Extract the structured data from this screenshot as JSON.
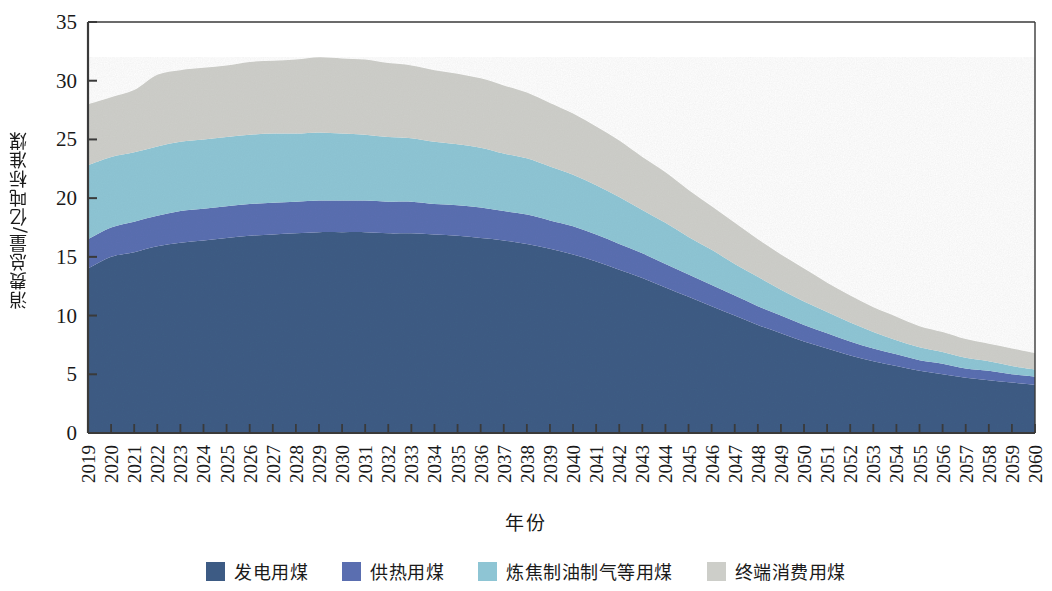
{
  "chart_data": {
    "type": "area",
    "stacked": true,
    "title": "",
    "xlabel": "年份",
    "ylabel": "消费总量/亿吨标准煤",
    "xlim": [
      2019,
      2060
    ],
    "ylim": [
      0,
      35
    ],
    "ytick_step": 5,
    "yticks": [
      0,
      5,
      10,
      15,
      20,
      25,
      30,
      35
    ],
    "grid": false,
    "legend_position": "bottom",
    "categories": [
      2019,
      2020,
      2021,
      2022,
      2023,
      2024,
      2025,
      2026,
      2027,
      2028,
      2029,
      2030,
      2031,
      2032,
      2033,
      2034,
      2035,
      2036,
      2037,
      2038,
      2039,
      2040,
      2041,
      2042,
      2043,
      2044,
      2045,
      2046,
      2047,
      2048,
      2049,
      2050,
      2051,
      2052,
      2053,
      2054,
      2055,
      2056,
      2057,
      2058,
      2059,
      2060
    ],
    "series": [
      {
        "name": "发电用煤",
        "color": "#3d5b84",
        "values": [
          14.0,
          15.0,
          15.4,
          15.9,
          16.2,
          16.4,
          16.6,
          16.8,
          16.9,
          17.0,
          17.1,
          17.1,
          17.1,
          17.0,
          17.0,
          16.9,
          16.8,
          16.6,
          16.4,
          16.1,
          15.7,
          15.2,
          14.6,
          13.9,
          13.2,
          12.4,
          11.6,
          10.8,
          10.0,
          9.2,
          8.5,
          7.8,
          7.2,
          6.6,
          6.1,
          5.7,
          5.3,
          5.0,
          4.7,
          4.5,
          4.3,
          4.1
        ]
      },
      {
        "name": "供热用煤",
        "color": "#5a6eb0",
        "values": [
          2.5,
          2.5,
          2.6,
          2.6,
          2.7,
          2.7,
          2.7,
          2.7,
          2.7,
          2.7,
          2.7,
          2.7,
          2.7,
          2.7,
          2.7,
          2.6,
          2.6,
          2.6,
          2.5,
          2.5,
          2.4,
          2.4,
          2.3,
          2.2,
          2.1,
          2.0,
          1.9,
          1.8,
          1.7,
          1.6,
          1.5,
          1.4,
          1.3,
          1.2,
          1.1,
          1.0,
          0.9,
          0.9,
          0.8,
          0.8,
          0.7,
          0.7
        ]
      },
      {
        "name": "炼焦制油制气等用煤",
        "color": "#8ec5d4",
        "values": [
          6.3,
          6.0,
          5.9,
          5.9,
          5.9,
          5.9,
          5.9,
          5.9,
          5.9,
          5.8,
          5.8,
          5.7,
          5.6,
          5.5,
          5.4,
          5.3,
          5.2,
          5.1,
          4.9,
          4.8,
          4.6,
          4.4,
          4.2,
          4.0,
          3.7,
          3.5,
          3.2,
          3.0,
          2.7,
          2.5,
          2.2,
          2.0,
          1.8,
          1.6,
          1.4,
          1.2,
          1.1,
          1.0,
          0.9,
          0.8,
          0.7,
          0.6
        ]
      },
      {
        "name": "终端消费用煤",
        "color": "#cdcec9",
        "values": [
          5.2,
          5.1,
          5.3,
          6.1,
          6.1,
          6.1,
          6.1,
          6.2,
          6.2,
          6.3,
          6.4,
          6.4,
          6.4,
          6.3,
          6.2,
          6.1,
          6.0,
          5.9,
          5.8,
          5.6,
          5.4,
          5.2,
          5.0,
          4.8,
          4.5,
          4.3,
          4.0,
          3.7,
          3.5,
          3.2,
          3.0,
          2.8,
          2.5,
          2.3,
          2.1,
          2.0,
          1.8,
          1.7,
          1.6,
          1.5,
          1.5,
          1.4
        ]
      }
    ],
    "totals": [
      28.0,
      28.6,
      29.2,
      30.5,
      30.9,
      31.1,
      31.3,
      31.6,
      31.7,
      31.8,
      32.0,
      31.9,
      31.8,
      31.5,
      31.3,
      30.9,
      30.6,
      30.2,
      29.6,
      29.0,
      28.1,
      27.2,
      26.1,
      24.9,
      23.5,
      22.2,
      20.7,
      19.3,
      17.9,
      16.5,
      15.2,
      14.0,
      12.8,
      11.7,
      10.7,
      9.9,
      9.1,
      8.6,
      8.0,
      7.6,
      7.2,
      6.8
    ]
  },
  "axes": {
    "y_title": "消费总量/亿吨标准煤",
    "x_title": "年份",
    "y_tick_labels": [
      "0",
      "5",
      "10",
      "15",
      "20",
      "25",
      "30",
      "35"
    ],
    "x_tick_labels": [
      "2019",
      "2020",
      "2021",
      "2022",
      "2023",
      "2024",
      "2025",
      "2026",
      "2027",
      "2028",
      "2029",
      "2030",
      "2031",
      "2032",
      "2033",
      "2034",
      "2035",
      "2036",
      "2037",
      "2038",
      "2039",
      "2040",
      "2041",
      "2042",
      "2043",
      "2044",
      "2045",
      "2046",
      "2047",
      "2048",
      "2049",
      "2050",
      "2051",
      "2052",
      "2053",
      "2054",
      "2055",
      "2056",
      "2057",
      "2058",
      "2059",
      "2060"
    ]
  },
  "legend": {
    "items": [
      {
        "label": "发电用煤",
        "color": "#3d5b84"
      },
      {
        "label": "供热用煤",
        "color": "#5a6eb0"
      },
      {
        "label": "炼焦制油制气等用煤",
        "color": "#8ec5d4"
      },
      {
        "label": "终端消费用煤",
        "color": "#cdcec9"
      }
    ]
  },
  "style": {
    "axis_color": "#3a3a3a",
    "background": "#ffffff",
    "text_color": "#1a1a1a"
  }
}
